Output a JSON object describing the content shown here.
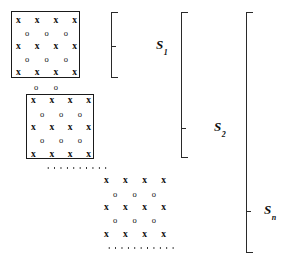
{
  "figure": {
    "type": "block-matrix-diagram",
    "mark_x": "x",
    "mark_o": "o",
    "ink_color": "#111111",
    "background_color": "#ffffff"
  },
  "blocks": [
    {
      "id": "block-1",
      "boxed": true,
      "left": 11,
      "top": 11,
      "width": 69,
      "height": 67,
      "rows": [
        {
          "type": "x",
          "count": 4
        },
        {
          "type": "o",
          "count": 3
        },
        {
          "type": "x",
          "count": 4
        },
        {
          "type": "o",
          "count": 3
        },
        {
          "type": "x",
          "count": 4
        }
      ]
    },
    {
      "id": "block-2",
      "boxed": true,
      "left": 26,
      "top": 94,
      "width": 68,
      "height": 65,
      "rows": [
        {
          "type": "x",
          "count": 4
        },
        {
          "type": "o",
          "count": 3
        },
        {
          "type": "x",
          "count": 4
        },
        {
          "type": "o",
          "count": 3
        },
        {
          "type": "x",
          "count": 4
        }
      ]
    },
    {
      "id": "block-n",
      "boxed": false,
      "left": 104,
      "top": 176,
      "width": 66,
      "height": 64,
      "rows": [
        {
          "type": "x",
          "count": 4
        },
        {
          "type": "o",
          "count": 3
        },
        {
          "type": "x",
          "count": 4
        },
        {
          "type": "o",
          "count": 3
        },
        {
          "type": "x",
          "count": 4
        }
      ]
    }
  ],
  "interblock_marks": [
    {
      "id": "between-1-2",
      "type": "o",
      "count": 2,
      "left": 34,
      "top": 84,
      "width": 24
    }
  ],
  "dotted_lines": [
    {
      "id": "dots-upper",
      "left": 45,
      "top": 167,
      "width": 62
    },
    {
      "id": "dots-lower",
      "left": 106,
      "top": 247,
      "width": 70
    }
  ],
  "brackets": [
    {
      "id": "bracket-s1",
      "left": 111,
      "top": 12,
      "height": 66,
      "tick_offset": 33
    },
    {
      "id": "bracket-s2",
      "left": 181,
      "top": 12,
      "height": 146,
      "tick_offset": 115
    },
    {
      "id": "bracket-sn",
      "left": 246,
      "top": 12,
      "height": 241,
      "tick_offset": 198
    }
  ],
  "labels": {
    "s1": {
      "base": "S",
      "sub": "1",
      "left": 156,
      "top": 38
    },
    "s2": {
      "base": "S",
      "sub": "2",
      "left": 214,
      "top": 120
    },
    "sn": {
      "base": "S",
      "sub": "n",
      "left": 264,
      "top": 203
    }
  }
}
